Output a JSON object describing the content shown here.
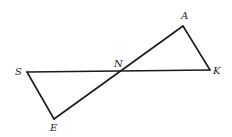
{
  "diagram": {
    "type": "geometry",
    "points": {
      "A": {
        "label": "A",
        "x": 183,
        "y": 26,
        "lx": 181,
        "ly": 19
      },
      "K": {
        "label": "K",
        "x": 210,
        "y": 70,
        "lx": 213,
        "ly": 74
      },
      "S": {
        "label": "S",
        "x": 27,
        "y": 72,
        "lx": 15,
        "ly": 75
      },
      "E": {
        "label": "E",
        "x": 54,
        "y": 119,
        "lx": 50,
        "ly": 131
      },
      "N": {
        "label": "N",
        "x": 122,
        "y": 71,
        "lx": 114,
        "ly": 67
      }
    },
    "segments": [
      {
        "from": "S",
        "to": "K"
      },
      {
        "from": "E",
        "to": "A"
      },
      {
        "from": "A",
        "to": "K"
      },
      {
        "from": "S",
        "to": "E"
      }
    ],
    "stroke_color": "#1a1a1a",
    "background": "#ffffff"
  }
}
